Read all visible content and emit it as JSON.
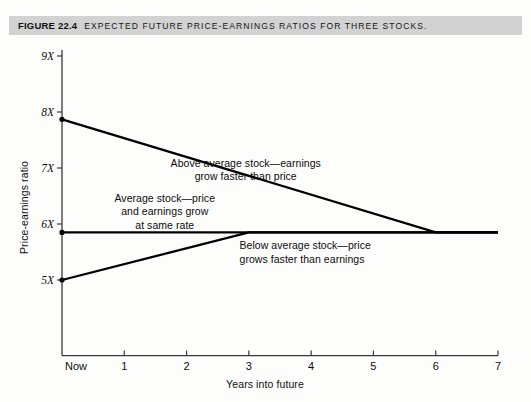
{
  "figure": {
    "number_label": "FIGURE 22.4",
    "caption": "EXPECTED FUTURE PRICE-EARNINGS RATIOS FOR THREE STOCKS.",
    "caption_bar_color": "#d2d2d2",
    "page_background": "#fdfdfc",
    "line_color": "#000000",
    "axis_color": "#3a3a3a"
  },
  "chart_data": {
    "type": "line",
    "title": "EXPECTED FUTURE PRICE-EARNINGS RATIOS FOR THREE STOCKS.",
    "xlabel": "Years into future",
    "ylabel": "Price-earnings ratio",
    "xlim": [
      0,
      7
    ],
    "ylim": [
      4.3,
      9
    ],
    "grid": false,
    "legend_position": "inline-annotations",
    "x_tick_values": [
      0,
      1,
      2,
      3,
      4,
      5,
      6,
      7
    ],
    "x_tick_labels": [
      "Now",
      "1",
      "2",
      "3",
      "4",
      "5",
      "6",
      "7"
    ],
    "y_tick_values": [
      5,
      6,
      7,
      8,
      9
    ],
    "y_tick_labels": [
      "5X",
      "6X",
      "7X",
      "8X",
      "9X"
    ],
    "series": [
      {
        "name": "Above average stock",
        "description": "Above average stock—earnings grow faster than price",
        "x": [
          0,
          6,
          7
        ],
        "values": [
          7.87,
          5.85,
          5.85
        ]
      },
      {
        "name": "Average stock",
        "description": "Average stock—price and earnings grow at same rate",
        "x": [
          0,
          7
        ],
        "values": [
          5.85,
          5.85
        ]
      },
      {
        "name": "Below average stock",
        "description": "Below average stock—price grows faster than earnings",
        "x": [
          0,
          3,
          7
        ],
        "values": [
          5.0,
          5.85,
          5.85
        ]
      }
    ],
    "annotations": [
      {
        "id": "above-average",
        "lines": [
          "Above average stock—earnings",
          "grow faster than price"
        ],
        "x_data": 2.95,
        "y_data": 7.08
      },
      {
        "id": "average",
        "lines": [
          "Average stock—price",
          "and earnings grow",
          "at same rate"
        ],
        "x_data": 1.65,
        "y_data": 6.45
      },
      {
        "id": "below-average",
        "lines": [
          "Below average stock—price",
          "grows faster than earnings"
        ],
        "x_data": 2.85,
        "y_data": 5.6
      }
    ]
  }
}
